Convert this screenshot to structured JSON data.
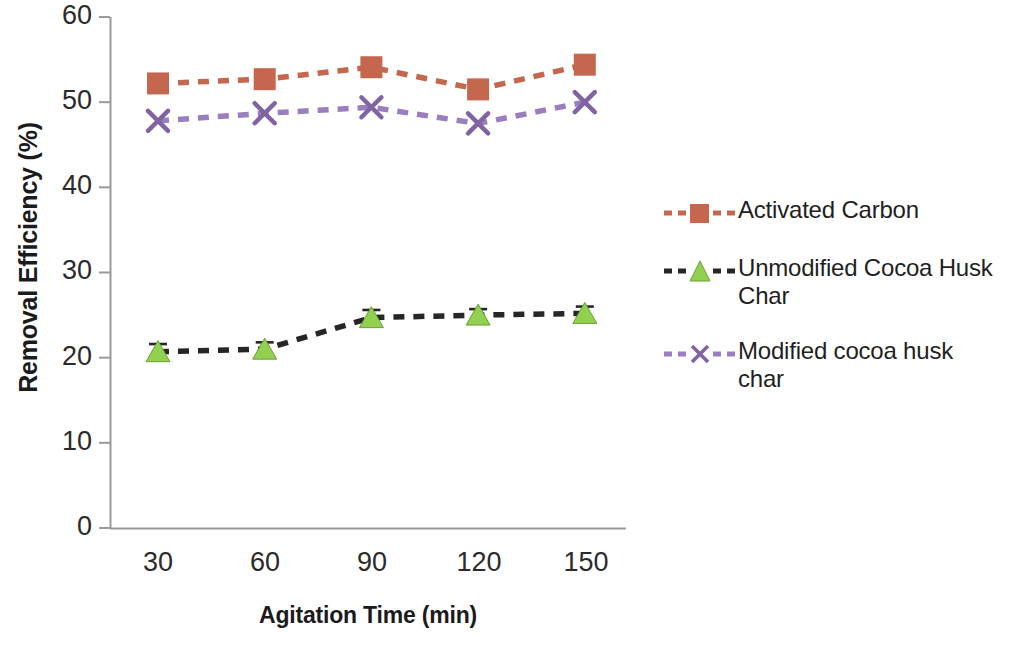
{
  "chart_data": {
    "type": "line",
    "title": "",
    "subtitle": "",
    "xlabel": "Agitation Time (min)",
    "ylabel": "Removal Efficiency (%)",
    "categories": [
      "30",
      "60",
      "90",
      "120",
      "150"
    ],
    "x": [
      30,
      60,
      90,
      120,
      150
    ],
    "ylim": [
      0,
      60
    ],
    "ytick_labels": [
      "0",
      "10",
      "20",
      "30",
      "40",
      "50",
      "60"
    ],
    "yticks": [
      0,
      10,
      20,
      30,
      40,
      50,
      60
    ],
    "grid": false,
    "legend_position": "right",
    "series": [
      {
        "name": "Activated Carbon",
        "values": [
          52.2,
          52.7,
          54.1,
          51.5,
          54.4
        ],
        "color": "#C4674E",
        "line_color": "#C4674E",
        "marker": "square",
        "line_style": "dashed",
        "errors": [
          0,
          0,
          0,
          0,
          0
        ]
      },
      {
        "name": "Unmodified Cocoa Husk Char",
        "values": [
          20.7,
          21.0,
          24.7,
          25.0,
          25.2
        ],
        "color": "#92D050",
        "line_color": "#262626",
        "marker": "triangle",
        "line_style": "dashed",
        "errors": [
          0.9,
          0.8,
          0.9,
          0.7,
          0.8
        ]
      },
      {
        "name": "Modified cocoa husk char",
        "values": [
          47.8,
          48.7,
          49.4,
          47.5,
          50.0
        ],
        "color": "#8064A2",
        "line_color": "#9A7FC0",
        "marker": "x",
        "line_style": "dashed",
        "errors": [
          0,
          0,
          0,
          0,
          0
        ]
      }
    ]
  },
  "axes": {
    "y_title": "Removal Efficiency (%)",
    "x_title": "Agitation Time (min)",
    "y_ticks": [
      "60",
      "50",
      "40",
      "30",
      "20",
      "10",
      "0"
    ],
    "x_ticks": [
      "30",
      "60",
      "90",
      "120",
      "150"
    ]
  },
  "legend": {
    "items": [
      {
        "label": "Activated Carbon",
        "color": "#C4674E",
        "marker": "square-marker-icon"
      },
      {
        "label": "Unmodified Cocoa Husk Char",
        "color": "#92D050",
        "marker": "triangle-marker-icon"
      },
      {
        "label": "Modified cocoa husk char",
        "color": "#8064A2",
        "marker": "x-marker-icon"
      }
    ]
  }
}
